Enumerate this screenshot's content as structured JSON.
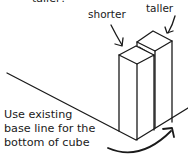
{
  "diagram": {
    "top_partial_text": "taller?",
    "labels": {
      "shorter": "shorter",
      "taller": "taller"
    },
    "caption": {
      "line1": "Use existing",
      "line2": "base line for the",
      "line3": "bottom of cube"
    },
    "colors": {
      "ink": "#1a1a1a",
      "background": "#ffffff"
    }
  }
}
